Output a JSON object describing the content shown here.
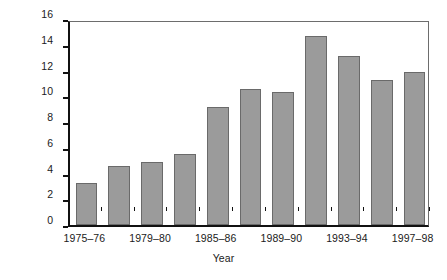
{
  "chart_data": {
    "type": "bar",
    "title": "",
    "xlabel": "Year",
    "ylabel": "Millions of 1998 dollars",
    "ylim": [
      0,
      16
    ],
    "yticks": [
      0,
      2,
      4,
      6,
      8,
      10,
      12,
      14,
      16
    ],
    "grid": false,
    "legend": null,
    "bar_color": "#9b9b9b",
    "bar_edge_color": "#6a6a6a",
    "categories": [
      "1975–76",
      "",
      "1979–80",
      "",
      "1985–86",
      "",
      "1989–90",
      "",
      "1993–94",
      "",
      "1997–98"
    ],
    "tick_labels": [
      "1975–76",
      "1979–80",
      "1985–86",
      "1989–90",
      "1993–94",
      "1997–98"
    ],
    "values": [
      3.25,
      4.6,
      4.9,
      5.5,
      9.2,
      10.55,
      10.35,
      14.65,
      13.15,
      11.3,
      11.85
    ],
    "bars": [
      {
        "label": "1975–76",
        "value": 3.25
      },
      {
        "label": "",
        "value": 4.6
      },
      {
        "label": "1979–80",
        "value": 4.9
      },
      {
        "label": "",
        "value": 5.5
      },
      {
        "label": "1985–86",
        "value": 9.2
      },
      {
        "label": "",
        "value": 10.55
      },
      {
        "label": "1989–90",
        "value": 10.35
      },
      {
        "label": "",
        "value": 14.65
      },
      {
        "label": "1993–94",
        "value": 13.15
      },
      {
        "label": "",
        "value": 11.3
      },
      {
        "label": "1997–98",
        "value": 11.85
      }
    ]
  }
}
